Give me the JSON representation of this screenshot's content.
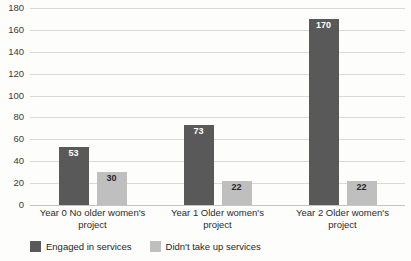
{
  "chart_data": {
    "type": "bar",
    "title": "",
    "subtitle": "",
    "xlabel": "",
    "ylabel": "",
    "ylim": [
      0,
      180
    ],
    "yticks": [
      0,
      20,
      40,
      60,
      80,
      100,
      120,
      140,
      160,
      180
    ],
    "grid": true,
    "legend_position": "bottom-left",
    "grouping": "grouped",
    "categories": [
      "Year 0 No older women's project",
      "Year 1 Older women's project",
      "Year 2 Older women's project"
    ],
    "series": [
      {
        "name": "Engaged in services",
        "color": "#595959",
        "values": [
          53,
          73,
          170
        ],
        "labels": [
          "53",
          "73",
          "170"
        ]
      },
      {
        "name": "Didn't take up services",
        "color": "#BFBFBF",
        "values": [
          30,
          22,
          22
        ],
        "labels": [
          "30",
          "22",
          "22"
        ]
      }
    ]
  },
  "axis": {
    "ytick_labels": [
      "180",
      "160",
      "140",
      "120",
      "100",
      "80",
      "60",
      "40",
      "20",
      "0"
    ]
  },
  "category_labels": [
    {
      "line1": "Year 0 No older women's",
      "line2": "project"
    },
    {
      "line1": "Year 1 Older women's",
      "line2": "project"
    },
    {
      "line1": "Year 2 Older women's",
      "line2": "project"
    }
  ],
  "legend": {
    "items": [
      {
        "label": "Engaged in services",
        "color": "#595959"
      },
      {
        "label": "Didn't take up services",
        "color": "#BFBFBF"
      }
    ]
  }
}
